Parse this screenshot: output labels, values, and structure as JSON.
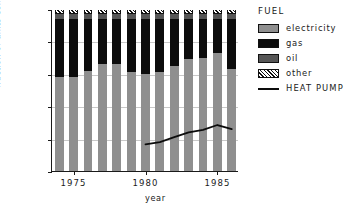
{
  "chart_data": {
    "type": "bar",
    "subtype": "stacked-bar-with-line-overlay",
    "title": "",
    "xlabel": "year",
    "ylabel": "fraction of units completed (%)",
    "ylim": [
      0,
      100
    ],
    "yticks": [
      0,
      20,
      40,
      60,
      80,
      100
    ],
    "ytick_labels": [
      "0",
      "20",
      "40",
      "60",
      "80",
      "100"
    ],
    "xlim": [
      1973.5,
      1986.5
    ],
    "xticks": [
      1975,
      1980,
      1985
    ],
    "xtick_labels": [
      "1975",
      "1980",
      "1985"
    ],
    "grid": true,
    "grid_axis": "y",
    "legend_title": "FUEL",
    "legend_position": "right",
    "categories": [
      1974,
      1975,
      1976,
      1977,
      1978,
      1979,
      1980,
      1981,
      1982,
      1983,
      1984,
      1985,
      1986
    ],
    "series": [
      {
        "name": "electricity",
        "color": "#8f8f8f",
        "values": [
          58,
          58,
          62,
          66,
          66,
          61,
          60,
          61,
          65,
          69,
          70,
          73,
          63
        ]
      },
      {
        "name": "gas",
        "color": "#0c0c0c",
        "values": [
          36,
          36,
          32,
          28,
          28,
          33,
          34,
          33,
          29,
          25,
          24,
          21,
          31
        ]
      },
      {
        "name": "oil",
        "color": "#565656",
        "values": [
          3,
          3,
          3,
          3,
          3,
          3,
          3,
          3,
          3,
          3,
          3,
          3,
          3
        ]
      },
      {
        "name": "other",
        "color": "hatch",
        "values": [
          3,
          3,
          3,
          3,
          3,
          3,
          3,
          3,
          3,
          3,
          3,
          3,
          3
        ]
      }
    ],
    "overlay_line": {
      "name": "HEAT PUMP",
      "color": "#0c0c0c",
      "x": [
        1980,
        1981,
        1982,
        1983,
        1984,
        1985,
        1986
      ],
      "y": [
        17,
        18.5,
        21.5,
        24.5,
        26,
        29,
        26.5
      ]
    }
  },
  "axes": {
    "ylabel": "fraction of units completed (%)",
    "xlabel": "year",
    "ytick_labels": [
      "100",
      "80",
      "60",
      "40",
      "20",
      "0"
    ],
    "xtick_labels": [
      "1975",
      "1980",
      "1985"
    ]
  },
  "legend": {
    "title": "FUEL",
    "items": [
      {
        "label": "electricity",
        "swatch": "electricity-swatch"
      },
      {
        "label": "gas",
        "swatch": "gas-swatch"
      },
      {
        "label": "oil",
        "swatch": "oil-swatch"
      },
      {
        "label": "other",
        "swatch": "other-hatch-swatch"
      },
      {
        "label": "HEAT PUMP",
        "swatch": "heat-pump-line-swatch"
      }
    ]
  }
}
